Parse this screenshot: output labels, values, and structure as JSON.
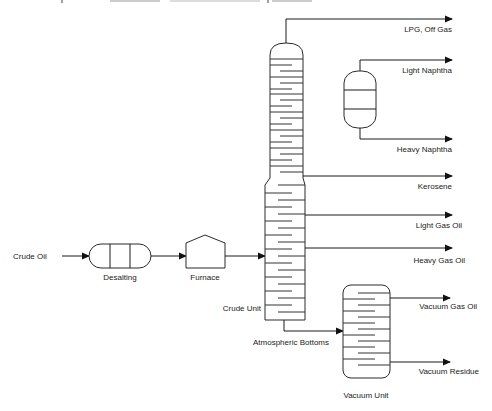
{
  "diagram": {
    "title_fragment": "...",
    "feed": {
      "label": "Crude Oil"
    },
    "units": {
      "desalting": {
        "label": "Desalting"
      },
      "furnace": {
        "label": "Furnace"
      },
      "crude_unit": {
        "label": "Crude Unit"
      },
      "naphtha_splitter": {
        "label": ""
      },
      "vacuum_unit": {
        "label": "Vacuum Unit"
      }
    },
    "streams": {
      "lpg": "LPG, Off Gas",
      "light_naphtha": "Light Naphtha",
      "heavy_naphtha": "Heavy Naphtha",
      "kerosene": "Kerosene",
      "light_gas_oil": "Light Gas Oil",
      "heavy_gas_oil": "Heavy Gas Oil",
      "atmospheric_bottoms": "Atmospheric Bottoms",
      "vacuum_gas_oil": "Vacuum Gas Oil",
      "vacuum_residue": "Vacuum Residue"
    },
    "colors": {
      "line": "#1a1a1a",
      "text": "#222222",
      "background": "#ffffff"
    }
  }
}
